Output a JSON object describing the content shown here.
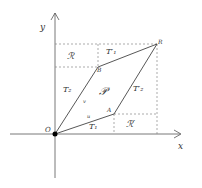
{
  "diagram": {
    "axes": {
      "x_label": "x",
      "y_label": "y"
    },
    "points": {
      "O": {
        "label": "O",
        "x": 55,
        "y": 134
      },
      "A": {
        "label": "A",
        "x": 114,
        "y": 114
      },
      "B": {
        "label": "B",
        "x": 98,
        "y": 67
      },
      "R": {
        "label": "R",
        "x": 157,
        "y": 44
      }
    },
    "regions": {
      "R": "ℛ",
      "R_prime": "ℛ′",
      "P": "𝒫",
      "T1": "T₁",
      "T2": "T₂",
      "T1_prime": "T′₁",
      "T2_prime": "T′₂"
    },
    "edge_labels": {
      "u": "u",
      "v": "v"
    },
    "colors": {
      "line": "#444444",
      "dash": "#777777",
      "text": "#333333"
    }
  }
}
